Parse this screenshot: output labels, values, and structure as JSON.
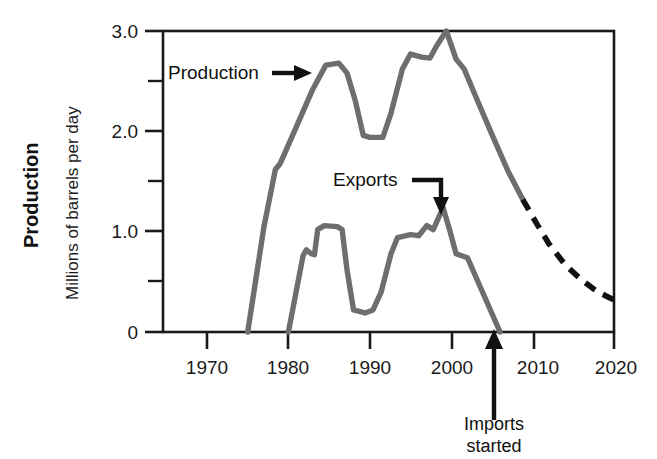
{
  "chart_data": {
    "type": "line",
    "title": "",
    "xlabel": "",
    "ylabel_bold": "Production",
    "ylabel_units": "Millions of barrels per day",
    "xlim": [
      1965,
      2020
    ],
    "ylim": [
      0,
      3.0
    ],
    "grid": false,
    "legend_position": "inline-annotations",
    "x_ticks": [
      "1970",
      "1980",
      "1990",
      "2000",
      "2010",
      "2020"
    ],
    "x_tick_values": [
      1970,
      1980,
      1990,
      2000,
      2010,
      2020
    ],
    "y_ticks": [
      "0",
      "1.0",
      "2.0",
      "3.0"
    ],
    "y_tick_values": [
      0,
      1.0,
      2.0,
      3.0
    ],
    "y_minor_tick_values": [
      0.5,
      1.5,
      2.5
    ],
    "colors": {
      "series_line": "#6e6e6e",
      "projection_line": "#111111",
      "axis": "#1a1a1a",
      "text": "#111111",
      "background": "#ffffff"
    },
    "series": [
      {
        "name": "Production",
        "style": "solid",
        "color": "#6e6e6e",
        "points": [
          [
            1975.0,
            0.0
          ],
          [
            1977.0,
            1.05
          ],
          [
            1978.4,
            1.62
          ],
          [
            1979.0,
            1.68
          ],
          [
            1981.0,
            2.05
          ],
          [
            1983.0,
            2.42
          ],
          [
            1984.6,
            2.66
          ],
          [
            1986.2,
            2.68
          ],
          [
            1987.2,
            2.58
          ],
          [
            1988.2,
            2.31
          ],
          [
            1989.2,
            1.96
          ],
          [
            1990.0,
            1.94
          ],
          [
            1991.6,
            1.94
          ],
          [
            1992.6,
            2.18
          ],
          [
            1994.0,
            2.62
          ],
          [
            1995.0,
            2.77
          ],
          [
            1996.4,
            2.74
          ],
          [
            1997.4,
            2.73
          ],
          [
            1998.2,
            2.85
          ],
          [
            1999.4,
            3.0
          ],
          [
            2000.6,
            2.72
          ],
          [
            2001.6,
            2.62
          ],
          [
            2003.0,
            2.35
          ],
          [
            2005.0,
            1.97
          ],
          [
            2007.0,
            1.6
          ],
          [
            2008.8,
            1.32
          ]
        ]
      },
      {
        "name": "Production projection",
        "style": "dashed",
        "color": "#111111",
        "points": [
          [
            2008.8,
            1.32
          ],
          [
            2010.5,
            1.08
          ],
          [
            2012.0,
            0.88
          ],
          [
            2014.0,
            0.67
          ],
          [
            2016.0,
            0.52
          ],
          [
            2018.0,
            0.4
          ],
          [
            2020.0,
            0.32
          ]
        ]
      },
      {
        "name": "Exports",
        "style": "solid",
        "color": "#6e6e6e",
        "points": [
          [
            1980.0,
            0.0
          ],
          [
            1981.8,
            0.76
          ],
          [
            1982.2,
            0.82
          ],
          [
            1982.8,
            0.78
          ],
          [
            1983.2,
            0.77
          ],
          [
            1983.6,
            1.02
          ],
          [
            1984.4,
            1.06
          ],
          [
            1986.0,
            1.05
          ],
          [
            1986.6,
            1.02
          ],
          [
            1987.2,
            0.62
          ],
          [
            1988.0,
            0.22
          ],
          [
            1989.4,
            0.19
          ],
          [
            1990.4,
            0.22
          ],
          [
            1991.4,
            0.4
          ],
          [
            1992.6,
            0.78
          ],
          [
            1993.4,
            0.94
          ],
          [
            1995.0,
            0.97
          ],
          [
            1996.0,
            0.96
          ],
          [
            1997.0,
            1.06
          ],
          [
            1997.8,
            1.02
          ],
          [
            1999.0,
            1.24
          ],
          [
            1999.8,
            1.02
          ],
          [
            2000.6,
            0.78
          ],
          [
            2002.0,
            0.74
          ],
          [
            2006.0,
            0.0
          ]
        ]
      }
    ],
    "annotations": [
      {
        "name": "production-label",
        "text": "Production",
        "arrow": "right"
      },
      {
        "name": "exports-label",
        "text": "Exports",
        "arrow": "elbow-down"
      },
      {
        "name": "imports-started-label",
        "text_line1": "Imports",
        "text_line2": "started",
        "arrow": "up",
        "x_value": 2006
      }
    ]
  }
}
